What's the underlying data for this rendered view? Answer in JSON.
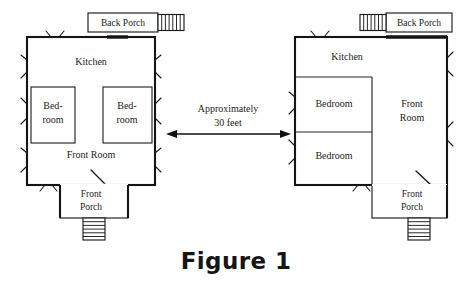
{
  "figure": {
    "caption": "Figure 1",
    "type": "architectural-floor-plan-diagram",
    "background_color": "#ffffff",
    "line_color": "#141414",
    "text_color": "#1a1a1a"
  },
  "dimension": {
    "line1": "Approximately",
    "line2": "30 feet",
    "arrow_style": "double-headed-horizontal"
  },
  "left_house": {
    "name": "left-floor-plan",
    "back_porch": {
      "label": "Back Porch",
      "steps_side": "right"
    },
    "rooms": [
      {
        "name": "kitchen",
        "label": "Kitchen"
      },
      {
        "name": "bedroom-left",
        "label_line1": "Bed-",
        "label_line2": "room"
      },
      {
        "name": "bedroom-right",
        "label_line1": "Bed-",
        "label_line2": "room"
      },
      {
        "name": "front-room",
        "label": "Front  Room"
      }
    ],
    "front_porch": {
      "label_line1": "Front",
      "label_line2": "Porch",
      "steps_side": "bottom"
    }
  },
  "right_house": {
    "name": "right-floor-plan",
    "back_porch": {
      "label": "Back Porch",
      "steps_side": "left"
    },
    "rooms": [
      {
        "name": "kitchen",
        "label": "Kitchen"
      },
      {
        "name": "bedroom-upper",
        "label": "Bedroom"
      },
      {
        "name": "bedroom-lower",
        "label": "Bedroom"
      },
      {
        "name": "front-room",
        "label_line1": "Front",
        "label_line2": "Room"
      }
    ],
    "front_porch": {
      "label_line1": "Front",
      "label_line2": "Porch",
      "steps_side": "bottom"
    }
  }
}
